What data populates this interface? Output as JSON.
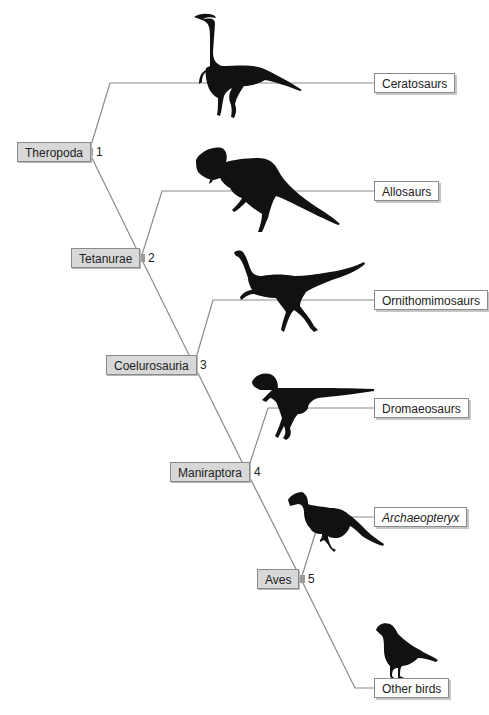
{
  "diagram": {
    "type": "cladogram",
    "title": "",
    "colors": {
      "branch_line": "#8a8a8a",
      "clade_box_fill": "#d8d8d8",
      "taxon_box_fill": "#ffffff",
      "node_marker": "#9a9a9a",
      "silhouette": "#111111"
    },
    "clades": [
      {
        "id": 1,
        "label": "Theropoda",
        "number": "1"
      },
      {
        "id": 2,
        "label": "Tetanurae",
        "number": "2"
      },
      {
        "id": 3,
        "label": "Coelurosauria",
        "number": "3"
      },
      {
        "id": 4,
        "label": "Maniraptora",
        "number": "4"
      },
      {
        "id": 5,
        "label": "Aves",
        "number": "5"
      }
    ],
    "taxa": [
      {
        "label": "Ceratosaurs",
        "italic": false,
        "silhouette": "ceratosaur-silhouette"
      },
      {
        "label": "Allosaurs",
        "italic": false,
        "silhouette": "allosaur-silhouette"
      },
      {
        "label": "Ornithomimosaurs",
        "italic": false,
        "silhouette": "ornithomimosaur-silhouette"
      },
      {
        "label": "Dromaeosaurs",
        "italic": false,
        "silhouette": "dromaeosaur-silhouette"
      },
      {
        "label": "Archaeopteryx",
        "italic": true,
        "silhouette": "archaeopteryx-silhouette"
      },
      {
        "label": "Other birds",
        "italic": false,
        "silhouette": "bird-silhouette"
      }
    ]
  }
}
